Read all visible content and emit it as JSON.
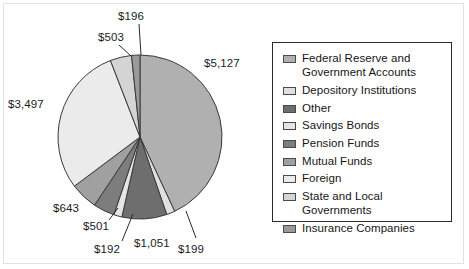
{
  "chart_data": {
    "type": "pie",
    "title": "",
    "subtitle": "",
    "xlabel": "",
    "ylabel": "",
    "legend_position": "right",
    "grid": false,
    "units": "dollars (billions)",
    "total": 11909,
    "start_angle_deg": 0,
    "direction": "clockwise",
    "categories": [
      "Federal Reserve and Government Accounts",
      "Depository Institutions",
      "Other",
      "Savings Bonds",
      "Pension Funds",
      "Mutual Funds",
      "Foreign",
      "State and Local Governments",
      "Insurance Companies"
    ],
    "values": [
      5127,
      199,
      1051,
      192,
      501,
      643,
      3497,
      503,
      196
    ],
    "data_labels": [
      "$5,127",
      "$199",
      "$1,051",
      "$192",
      "$501",
      "$643",
      "$3,497",
      "$503",
      "$196"
    ],
    "colors": [
      "#b0b0b0",
      "#e0e0e0",
      "#6e6e6e",
      "#e4e4e4",
      "#7d7d7d",
      "#a0a0a0",
      "#ebebeb",
      "#d4d4d4",
      "#9a9a9a"
    ],
    "slices": [
      {
        "label": "Federal Reserve and Government Accounts",
        "value": 5127,
        "data_label": "$5,127",
        "color": "#b0b0b0"
      },
      {
        "label": "Depository Institutions",
        "value": 199,
        "data_label": "$199",
        "color": "#e0e0e0"
      },
      {
        "label": "Other",
        "value": 1051,
        "data_label": "$1,051",
        "color": "#6e6e6e"
      },
      {
        "label": "Savings Bonds",
        "value": 192,
        "data_label": "$192",
        "color": "#e4e4e4"
      },
      {
        "label": "Pension Funds",
        "value": 501,
        "data_label": "$501",
        "color": "#7d7d7d"
      },
      {
        "label": "Mutual Funds",
        "value": 643,
        "data_label": "$643",
        "color": "#a0a0a0"
      },
      {
        "label": "Foreign",
        "value": 3497,
        "data_label": "$3,497",
        "color": "#ebebeb"
      },
      {
        "label": "State and Local Governments",
        "value": 503,
        "data_label": "$503",
        "color": "#d4d4d4"
      },
      {
        "label": "Insurance Companies",
        "value": 196,
        "data_label": "$196",
        "color": "#9a9a9a"
      }
    ]
  },
  "pie": {
    "center_x": 140,
    "center_y": 137,
    "radius": 82,
    "stroke": "#3a3a3a"
  },
  "labels": [
    {
      "text": "$196",
      "x": 118,
      "y": 10,
      "leader": {
        "x1": 139,
        "y1": 24,
        "x2": 141,
        "y2": 55
      }
    },
    {
      "text": "$503",
      "x": 98,
      "y": 31,
      "leader": {
        "x1": 119,
        "y1": 45,
        "x2": 131,
        "y2": 56
      }
    },
    {
      "text": "$5,127",
      "x": 204,
      "y": 57,
      "leader": null
    },
    {
      "text": "$3,497",
      "x": 8,
      "y": 98,
      "leader": null
    },
    {
      "text": "$643",
      "x": 53,
      "y": 202,
      "leader": null
    },
    {
      "text": "$501",
      "x": 83,
      "y": 220,
      "leader": {
        "x1": 109,
        "y1": 220,
        "x2": 118,
        "y2": 208
      }
    },
    {
      "text": "$192",
      "x": 94,
      "y": 243,
      "leader": {
        "x1": 122,
        "y1": 241,
        "x2": 133,
        "y2": 214
      }
    },
    {
      "text": "$1,051",
      "x": 134,
      "y": 237,
      "leader": null
    },
    {
      "text": "$199",
      "x": 178,
      "y": 243,
      "leader": {
        "x1": 196,
        "y1": 238,
        "x2": 186,
        "y2": 211
      }
    }
  ],
  "legend": {
    "items": [
      {
        "label": "Federal Reserve and\nGovernment Accounts",
        "color": "#b0b0b0",
        "icon": "legend-swatch-icon"
      },
      {
        "label": "Depository Institutions",
        "color": "#e0e0e0",
        "icon": "legend-swatch-icon"
      },
      {
        "label": "Other",
        "color": "#6e6e6e",
        "icon": "legend-swatch-icon"
      },
      {
        "label": "Savings Bonds",
        "color": "#e4e4e4",
        "icon": "legend-swatch-icon"
      },
      {
        "label": "Pension Funds",
        "color": "#7d7d7d",
        "icon": "legend-swatch-icon"
      },
      {
        "label": "Mutual Funds",
        "color": "#a0a0a0",
        "icon": "legend-swatch-icon"
      },
      {
        "label": "Foreign",
        "color": "#ebebeb",
        "icon": "legend-swatch-icon"
      },
      {
        "label": "State and Local Governments",
        "color": "#d4d4d4",
        "icon": "legend-swatch-icon"
      },
      {
        "label": "Insurance Companies",
        "color": "#9a9a9a",
        "icon": "legend-swatch-icon"
      }
    ]
  }
}
